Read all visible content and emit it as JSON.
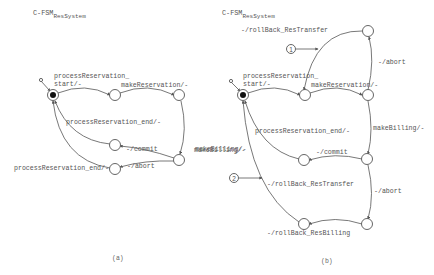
{
  "panel_a": {
    "title_main": "C-FSM",
    "title_sub": "ResSystem",
    "caption": "(a)",
    "labels": {
      "start": "processReservation_",
      "start2": "start/-",
      "make_reservation": "makeReservation/-",
      "process_end_top": "processReservation_end/-",
      "commit": "-/commit",
      "abort": "-/abort",
      "process_end_bottom": "processReservation_end/-",
      "make_billing": "makeBilling/-"
    }
  },
  "panel_b": {
    "title_main": "C-FSM",
    "title_sub": "ResSystem",
    "caption": "(b)",
    "labels": {
      "rollback_transfer_top": "-/rollBack_ResTransfer",
      "abort_top": "-/abort",
      "start": "processReservation_",
      "start2": "start/-",
      "make_reservation": "makeReservation/-",
      "process_end": "processReservation_end/-",
      "make_billing_right": "makeBilling/-",
      "make_billing_left": "makeBilling/-",
      "commit": "-/commit",
      "rollback_transfer_mid": "-/rollBack_ResTransfer",
      "abort_mid": "-/abort",
      "rollback_billing": "-/rollBack_ResBilling"
    },
    "markers": [
      "1",
      "2"
    ]
  },
  "colors": {
    "line": "#555555",
    "text": "#555555",
    "background": "#ffffff"
  }
}
